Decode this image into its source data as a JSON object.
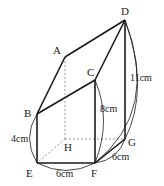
{
  "figure": {
    "type": "solid-geometry",
    "vertices": {
      "A": {
        "label": "A",
        "x": 65,
        "y": 57
      },
      "B": {
        "label": "B",
        "x": 37,
        "y": 114
      },
      "C": {
        "label": "C",
        "x": 95,
        "y": 80
      },
      "D": {
        "label": "D",
        "x": 125,
        "y": 20
      },
      "E": {
        "label": "E",
        "x": 37,
        "y": 163
      },
      "F": {
        "label": "F",
        "x": 95,
        "y": 163
      },
      "G": {
        "label": "G",
        "x": 125,
        "y": 139
      },
      "H": {
        "label": "H",
        "x": 65,
        "y": 139
      }
    },
    "measurements": {
      "BE": "4cm",
      "EF": "6cm",
      "FG": "6cm",
      "CF": "8cm",
      "DG": "11cm"
    },
    "colors": {
      "line": "#1a1a1a",
      "hidden": "#999999",
      "background": "#ffffff"
    }
  }
}
